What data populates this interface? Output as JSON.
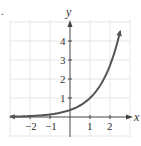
{
  "chart_data": {
    "type": "line",
    "title": "",
    "xlabel": "x",
    "ylabel": "y",
    "xlim": [
      -3,
      3
    ],
    "ylim": [
      -1,
      5
    ],
    "grid": true,
    "x_ticks": [
      "-2",
      "-1",
      "1",
      "2"
    ],
    "y_ticks": [
      "1",
      "2",
      "3",
      "4"
    ],
    "series": [
      {
        "name": "y = e^(x-1)",
        "x": [
          -3,
          -2.5,
          -2,
          -1.5,
          -1,
          -0.5,
          0,
          0.5,
          1,
          1.5,
          2,
          2.5
        ],
        "values": [
          0.02,
          0.03,
          0.05,
          0.08,
          0.14,
          0.22,
          0.37,
          0.61,
          1.0,
          1.65,
          2.72,
          4.48
        ]
      }
    ],
    "annotations": [
      "arrow at both ends of curve"
    ]
  },
  "labels": {
    "panel_marker": ".",
    "x_axis": "x",
    "y_axis": "y",
    "x_ticks": [
      "−2",
      "−1",
      "1",
      "2"
    ],
    "y_ticks": [
      "1",
      "2",
      "3",
      "4"
    ]
  },
  "colors": {
    "curve": "#555555",
    "axes": "#333333",
    "grid": "#e6e6e6"
  }
}
